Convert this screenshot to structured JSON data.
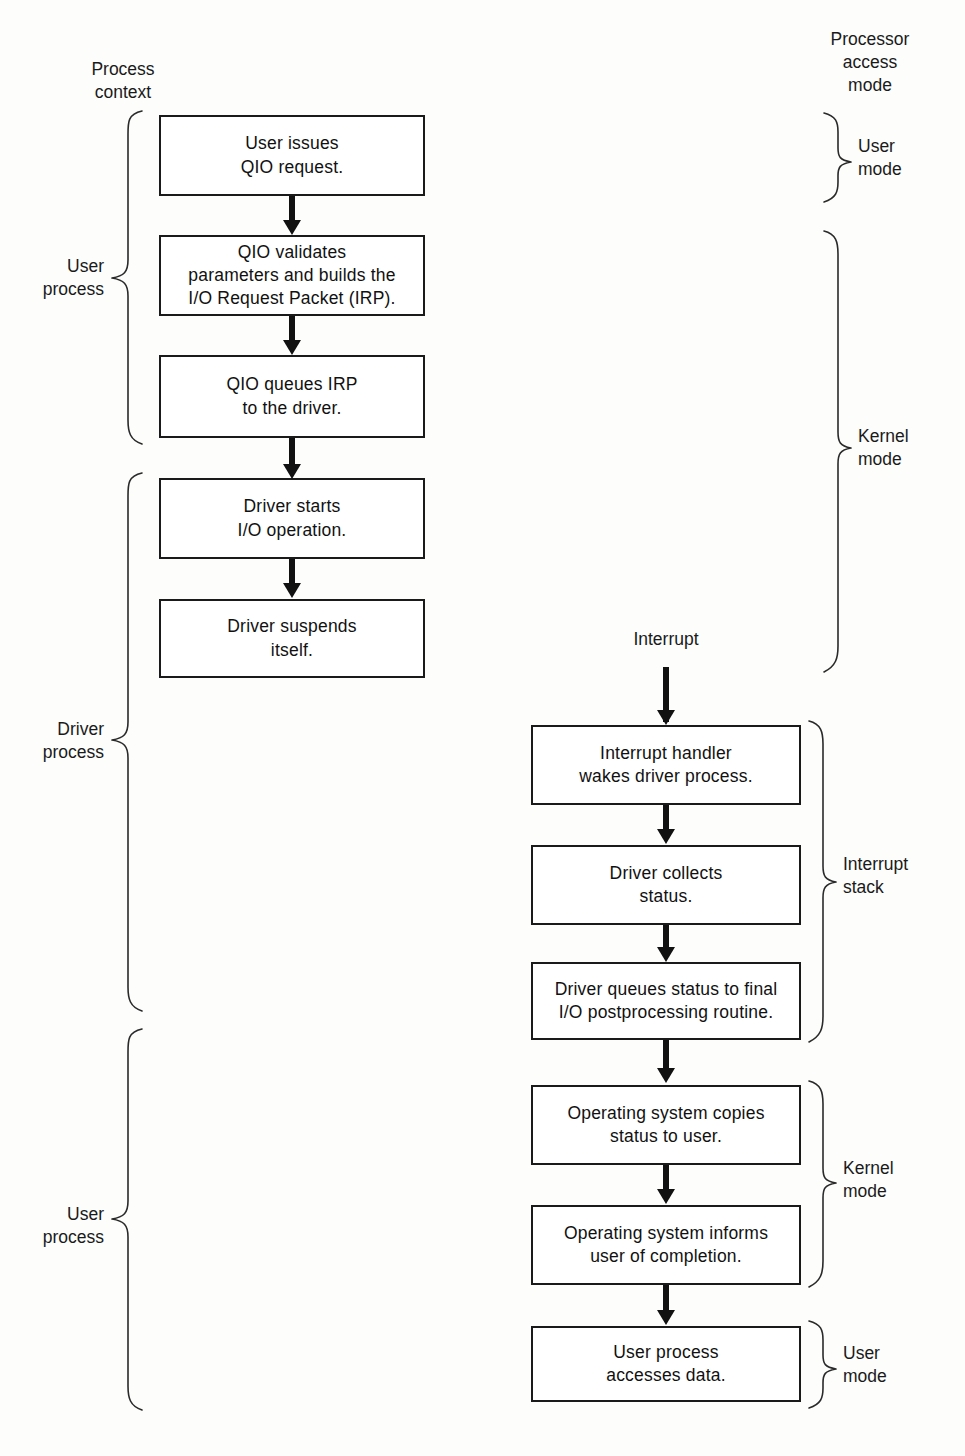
{
  "diagram": {
    "background_color": "#fdfdfc",
    "line_color": "#1a1a1a"
  },
  "headers": {
    "process_context": "Process\ncontext",
    "processor_access_mode": "Processor\naccess\nmode"
  },
  "left_column": {
    "nodes": [
      {
        "id": "user-issues-qio",
        "text": "User issues\nQIO request."
      },
      {
        "id": "qio-validates",
        "text": "QIO validates\nparameters and builds the\nI/O Request Packet (IRP)."
      },
      {
        "id": "qio-queues-irp",
        "text": "QIO queues IRP\nto the driver."
      },
      {
        "id": "driver-starts-io",
        "text": "Driver starts\nI/O operation."
      },
      {
        "id": "driver-suspends",
        "text": "Driver suspends\nitself."
      }
    ],
    "braces": [
      {
        "id": "user-process-upper",
        "label": "User\nprocess"
      },
      {
        "id": "driver-process",
        "label": "Driver\nprocess"
      },
      {
        "id": "user-process-lower",
        "label": "User\nprocess"
      }
    ]
  },
  "right_column": {
    "interrupt_label": "Interrupt",
    "nodes": [
      {
        "id": "interrupt-handler",
        "text": "Interrupt  handler\nwakes driver process."
      },
      {
        "id": "driver-collects-status",
        "text": "Driver collects\nstatus."
      },
      {
        "id": "driver-queues-status",
        "text": "Driver queues status to final\nI/O postprocessing routine."
      },
      {
        "id": "os-copies-status",
        "text": "Operating system copies\nstatus to user."
      },
      {
        "id": "os-informs-user",
        "text": "Operating system informs\nuser of completion."
      },
      {
        "id": "user-process-accesses-data",
        "text": "User process\naccesses data."
      }
    ],
    "braces": [
      {
        "id": "user-mode-top",
        "label": "User\nmode"
      },
      {
        "id": "kernel-mode-top",
        "label": "Kernel\nmode"
      },
      {
        "id": "interrupt-stack",
        "label": "Interrupt\nstack"
      },
      {
        "id": "kernel-mode-bottom",
        "label": "Kernel\nmode"
      },
      {
        "id": "user-mode-bottom",
        "label": "User\nmode"
      }
    ]
  }
}
